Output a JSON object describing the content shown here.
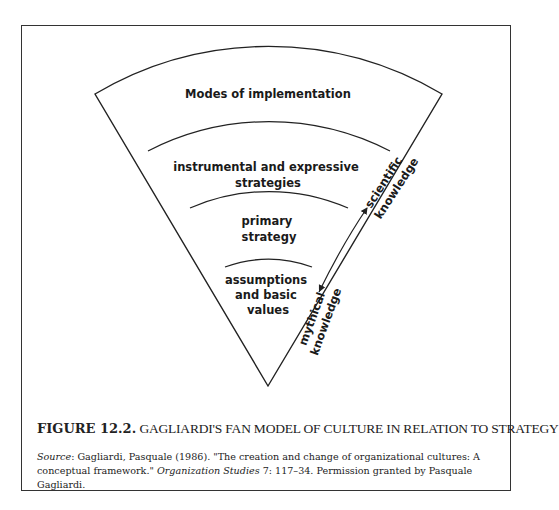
{
  "figure": {
    "layers": [
      {
        "id": "modes",
        "lines": [
          "Modes of implementation"
        ]
      },
      {
        "id": "instrumental",
        "lines": [
          "instrumental and expressive",
          "strategies"
        ]
      },
      {
        "id": "primary",
        "lines": [
          "primary",
          "strategy"
        ]
      },
      {
        "id": "assumptions",
        "lines": [
          "assumptions",
          "and basic",
          "values"
        ]
      }
    ],
    "arrow": {
      "top_label": [
        "scientific",
        "knowledge"
      ],
      "bottom_label": [
        "mythical",
        "knowledge"
      ]
    }
  },
  "caption": {
    "number": "FIGURE 12.2.",
    "title": "GAGLIARDI'S FAN MODEL OF CULTURE IN RELATION TO STRATEGY"
  },
  "source": {
    "label": "Source",
    "text_1": ": Gagliardi, Pasquale (1986). \"The creation and change of organizational cultures: A conceptual framework.\" ",
    "journal": "Organization Studies",
    "text_2": " 7: 117–34. Permission granted by Pasquale Gagliardi."
  }
}
